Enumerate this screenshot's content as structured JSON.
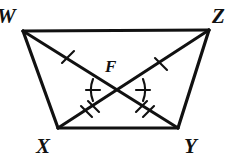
{
  "figure": {
    "kind": "geometry-diagram",
    "stroke_color": "#111111",
    "background_color": "#ffffff",
    "stroke_width": 2.6,
    "vertices": [
      {
        "name": "W",
        "label": "W",
        "x": 23,
        "y": 31,
        "label_x": -3,
        "label_y": 6
      },
      {
        "name": "Z",
        "label": "Z",
        "x": 209,
        "y": 30,
        "label_x": 212,
        "label_y": 6
      },
      {
        "name": "X",
        "label": "X",
        "x": 58,
        "y": 128,
        "label_x": 36,
        "label_y": 136
      },
      {
        "name": "Y",
        "label": "Y",
        "x": 178,
        "y": 128,
        "label_x": 184,
        "label_y": 136
      },
      {
        "name": "F",
        "label": "F",
        "x": 118,
        "y": 90,
        "label_x": 105,
        "label_y": 58
      }
    ],
    "sides": [
      {
        "name": "side-WZ",
        "from": "W",
        "to": "Z"
      },
      {
        "name": "side-ZY",
        "from": "Z",
        "to": "Y"
      },
      {
        "name": "side-XY",
        "from": "X",
        "to": "Y"
      },
      {
        "name": "side-WX",
        "from": "W",
        "to": "X"
      }
    ],
    "diagonals": [
      {
        "name": "diagonal-WY",
        "from": "W",
        "to": "Y"
      },
      {
        "name": "diagonal-ZX",
        "from": "Z",
        "to": "X"
      }
    ],
    "congruence_marks": [
      {
        "name": "tick-WF",
        "segment": "WF",
        "count": 1,
        "x": 68,
        "y": 58
      },
      {
        "name": "tick-ZF",
        "segment": "ZF",
        "count": 1,
        "x": 161,
        "y": 58
      },
      {
        "name": "tick-FX",
        "segment": "FX",
        "count": 2,
        "x": 88,
        "y": 109
      },
      {
        "name": "tick-FY",
        "segment": "FY",
        "count": 2,
        "x": 148,
        "y": 109
      }
    ],
    "angle_marks": [
      {
        "name": "angle-WFX",
        "vertex": "F",
        "side": "left",
        "ticks": 1
      },
      {
        "name": "angle-ZFY",
        "vertex": "F",
        "side": "right",
        "ticks": 1
      }
    ]
  }
}
